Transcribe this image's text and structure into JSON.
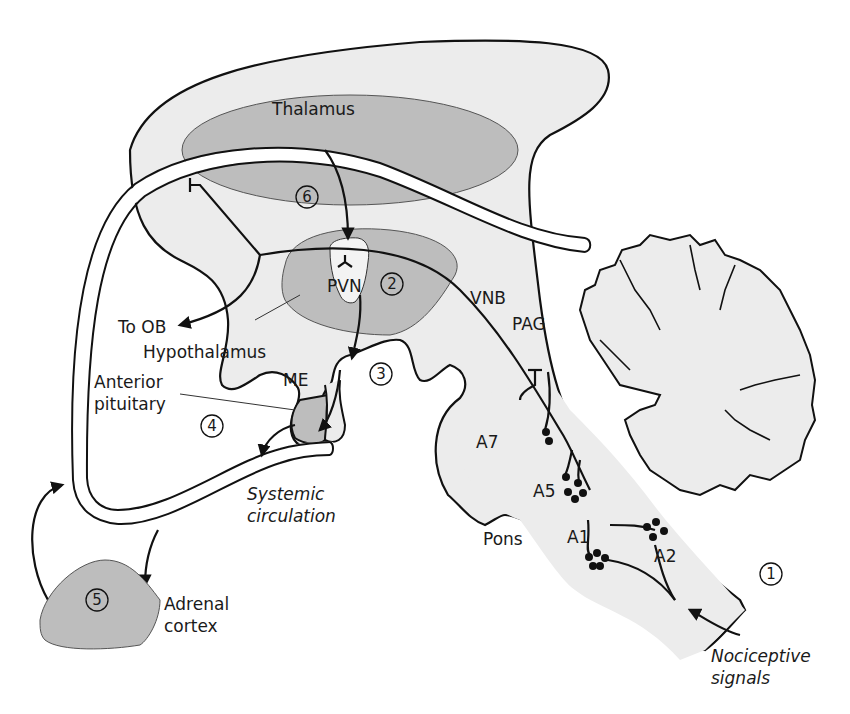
{
  "diagram": {
    "type": "anatomical-schematic",
    "labels": {
      "thalamus": "Thalamus",
      "pvn": "PVN",
      "hypothalamus": "Hypothalamus",
      "to_ob": "To OB",
      "me": "ME",
      "anterior_pituitary_1": "Anterior",
      "anterior_pituitary_2": "pituitary",
      "vnb": "VNB",
      "pag": "PAG",
      "a7": "A7",
      "a5": "A5",
      "a1": "A1",
      "a2": "A2",
      "pons": "Pons",
      "systemic_1": "Systemic",
      "systemic_2": "circulation",
      "adrenal_1": "Adrenal",
      "adrenal_2": "cortex",
      "nociceptive_1": "Nociceptive",
      "nociceptive_2": "signals"
    },
    "step_markers": {
      "s1": "1",
      "s2": "2",
      "s3": "3",
      "s4": "4",
      "s5": "5",
      "s6": "6"
    },
    "colors": {
      "brain_fill": "#ececec",
      "region_fill": "#bdbdbd",
      "outline": "#111111",
      "background": "#ffffff"
    }
  }
}
